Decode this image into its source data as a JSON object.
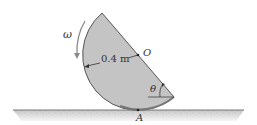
{
  "diagram": {
    "type": "mechanics-figure",
    "labels": {
      "omega": "ω",
      "radius": "0.4 m",
      "center": "O",
      "angle": "θ",
      "contact_point": "A"
    },
    "colors": {
      "disk_fill": "#c4c4c4",
      "disk_edge": "#555555",
      "ground": "#bdbdbd",
      "ground_line": "#6a6a6a",
      "arrow": "#888888"
    }
  }
}
